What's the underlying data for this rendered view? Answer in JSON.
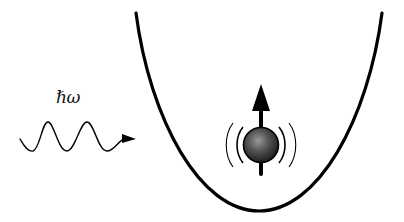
{
  "diagram": {
    "photon": {
      "label": "ℏω",
      "icon": "wavy-arrow-icon",
      "direction": "right"
    },
    "potential": {
      "shape": "parabola",
      "icon": "harmonic-potential-icon"
    },
    "particle": {
      "icon": "sphere-icon",
      "spin": "up",
      "spin_icon": "arrow-up-icon",
      "vibration_icon": "oscillation-arcs-icon"
    },
    "colors": {
      "stroke": "#000000",
      "sphere_light": "#9a9a9a",
      "sphere_mid": "#555555",
      "sphere_dark": "#1a1a1a",
      "background": "#ffffff"
    }
  }
}
